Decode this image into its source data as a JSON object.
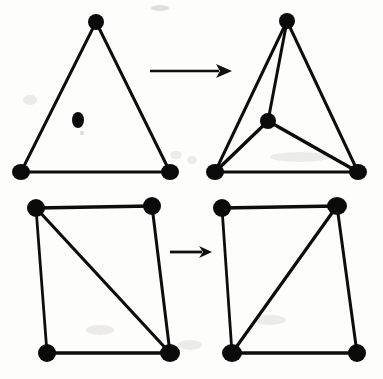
{
  "figure": {
    "background_color": "#fdfdfc",
    "ink_color": "#0d0d0d",
    "width": 383,
    "height": 379,
    "style": "scanned black ink line drawing"
  },
  "panels": [
    {
      "id": "top-left",
      "name": "triangle-with-interior-point",
      "caption": "Triangle containing a single free interior point",
      "vertices": [
        {
          "name": "apex",
          "x": 96,
          "y": 22,
          "rx": 8,
          "ry": 8
        },
        {
          "name": "bottom-left",
          "x": 21,
          "y": 172,
          "rx": 9,
          "ry": 8
        },
        {
          "name": "bottom-right",
          "x": 170,
          "y": 172,
          "rx": 9,
          "ry": 8
        },
        {
          "name": "interior-free-point",
          "x": 78,
          "y": 120,
          "rx": 6,
          "ry": 8
        }
      ],
      "edges": [
        {
          "name": "left-side",
          "from": "apex",
          "to": "bottom-left",
          "width": 3.0
        },
        {
          "name": "right-side",
          "from": "apex",
          "to": "bottom-right",
          "width": 3.0
        },
        {
          "name": "base",
          "from": "bottom-left",
          "to": "bottom-right",
          "width": 3.2
        }
      ]
    },
    {
      "id": "top-right",
      "name": "triangle-split-into-three",
      "caption": "Interior point connected to all three corners, splitting the triangle into three triangles",
      "vertices": [
        {
          "name": "apex",
          "x": 287,
          "y": 21,
          "rx": 8,
          "ry": 8
        },
        {
          "name": "bottom-left",
          "x": 215,
          "y": 172,
          "rx": 9,
          "ry": 8
        },
        {
          "name": "bottom-right",
          "x": 358,
          "y": 172,
          "rx": 9,
          "ry": 8
        },
        {
          "name": "interior-connected-point",
          "x": 268,
          "y": 121,
          "rx": 8,
          "ry": 8
        }
      ],
      "edges": [
        {
          "name": "left-side",
          "from": "apex",
          "to": "bottom-left",
          "width": 3.0
        },
        {
          "name": "right-side",
          "from": "apex",
          "to": "bottom-right",
          "width": 3.0
        },
        {
          "name": "base",
          "from": "bottom-left",
          "to": "bottom-right",
          "width": 3.2
        },
        {
          "name": "spoke-to-apex",
          "from": "interior-connected-point",
          "to": "apex",
          "width": 3.0
        },
        {
          "name": "spoke-to-bottom-left",
          "from": "interior-connected-point",
          "to": "bottom-left",
          "width": 3.4
        },
        {
          "name": "spoke-to-bottom-right",
          "from": "interior-connected-point",
          "to": "bottom-right",
          "width": 3.4
        }
      ]
    },
    {
      "id": "bottom-left",
      "name": "quad-diagonal-tl-br",
      "caption": "Quadrilateral triangulated by the diagonal from top-left to bottom-right",
      "vertices": [
        {
          "name": "top-left",
          "x": 36,
          "y": 208,
          "rx": 9,
          "ry": 9
        },
        {
          "name": "top-right",
          "x": 152,
          "y": 206,
          "rx": 9,
          "ry": 9
        },
        {
          "name": "bottom-left",
          "x": 47,
          "y": 353,
          "rx": 9,
          "ry": 9
        },
        {
          "name": "bottom-right",
          "x": 170,
          "y": 353,
          "rx": 10,
          "ry": 9
        }
      ],
      "edges": [
        {
          "name": "top-side",
          "from": "top-left",
          "to": "top-right",
          "width": 3.4
        },
        {
          "name": "left-side",
          "from": "top-left",
          "to": "bottom-left",
          "width": 2.8
        },
        {
          "name": "right-side",
          "from": "top-right",
          "to": "bottom-right",
          "width": 3.0
        },
        {
          "name": "bottom-side",
          "from": "bottom-left",
          "to": "bottom-right",
          "width": 3.4
        },
        {
          "name": "diagonal",
          "from": "top-left",
          "to": "bottom-right",
          "width": 3.2
        }
      ]
    },
    {
      "id": "bottom-right",
      "name": "quad-diagonal-tr-bl",
      "caption": "Same quadrilateral after the edge flip, diagonal now from top-right to bottom-left",
      "vertices": [
        {
          "name": "top-left",
          "x": 222,
          "y": 208,
          "rx": 9,
          "ry": 9
        },
        {
          "name": "top-right",
          "x": 337,
          "y": 206,
          "rx": 10,
          "ry": 9
        },
        {
          "name": "bottom-left",
          "x": 232,
          "y": 353,
          "rx": 10,
          "ry": 9
        },
        {
          "name": "bottom-right",
          "x": 357,
          "y": 353,
          "rx": 9,
          "ry": 9
        }
      ],
      "edges": [
        {
          "name": "top-side",
          "from": "top-left",
          "to": "top-right",
          "width": 3.4
        },
        {
          "name": "left-side",
          "from": "top-left",
          "to": "bottom-left",
          "width": 2.8
        },
        {
          "name": "right-side",
          "from": "top-right",
          "to": "bottom-right",
          "width": 3.0
        },
        {
          "name": "bottom-side",
          "from": "bottom-left",
          "to": "bottom-right",
          "width": 3.4
        },
        {
          "name": "diagonal",
          "from": "top-right",
          "to": "bottom-left",
          "width": 3.2
        }
      ]
    }
  ],
  "arrows": [
    {
      "id": "top-arrow",
      "name": "transformation-arrow-top",
      "direction": "right",
      "x1": 150,
      "y1": 71,
      "x2": 232,
      "y2": 71,
      "shaft_width": 2.6,
      "head_length": 16,
      "head_half_height": 7
    },
    {
      "id": "bottom-arrow",
      "name": "transformation-arrow-bottom",
      "direction": "right",
      "x1": 170,
      "y1": 252,
      "x2": 212,
      "y2": 252,
      "shaft_width": 2.8,
      "head_length": 13,
      "head_half_height": 6
    }
  ],
  "scan_artifacts": [
    {
      "name": "speck-below-interior-point",
      "x": 82,
      "y": 133,
      "rx": 2.2,
      "ry": 2.2
    },
    {
      "name": "smudge-left-of-triangle",
      "x": 30,
      "y": 100,
      "rx": 7,
      "ry": 5
    },
    {
      "name": "smudge-near-top-base",
      "x": 176,
      "y": 155,
      "rx": 6,
      "ry": 4
    },
    {
      "name": "smudge-right-base-shadow",
      "x": 300,
      "y": 157,
      "rx": 30,
      "ry": 5
    },
    {
      "name": "smudge-below-top-right-base",
      "x": 192,
      "y": 160,
      "rx": 5,
      "ry": 4
    },
    {
      "name": "smudge-between-quads",
      "x": 190,
      "y": 345,
      "rx": 12,
      "ry": 5
    },
    {
      "name": "smudge-bottom-left-quad",
      "x": 100,
      "y": 330,
      "rx": 14,
      "ry": 5
    },
    {
      "name": "smudge-bottom-right-quad",
      "x": 270,
      "y": 320,
      "rx": 16,
      "ry": 5
    },
    {
      "name": "speck-top-center",
      "x": 160,
      "y": 8,
      "rx": 9,
      "ry": 3
    }
  ]
}
